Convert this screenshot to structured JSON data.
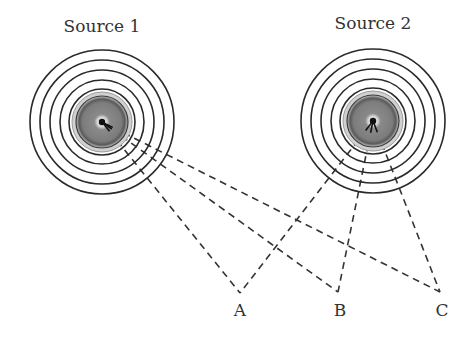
{
  "diagram": {
    "sources": [
      {
        "id": "source-1",
        "label": "Source 1",
        "cx": 102,
        "cy": 122,
        "label_x": 102,
        "label_y": 16
      },
      {
        "id": "source-2",
        "label": "Source 2",
        "cx": 373,
        "cy": 121,
        "label_x": 373,
        "label_y": 13
      }
    ],
    "ring_radii": [
      33,
      42,
      52,
      62,
      72
    ],
    "disc_radius": 28,
    "points": [
      {
        "id": "A",
        "label": "A",
        "x": 240,
        "y": 293,
        "label_x": 240,
        "label_y": 300
      },
      {
        "id": "B",
        "label": "B",
        "x": 338,
        "y": 292,
        "label_x": 340,
        "label_y": 300
      },
      {
        "id": "C",
        "label": "C",
        "x": 440,
        "y": 292,
        "label_x": 442,
        "label_y": 300
      }
    ],
    "colors": {
      "ring": "#2a2a2a",
      "disc_outer": "#bdbdbd",
      "disc_inner": "#7a7a7a",
      "path_line": "#333333"
    }
  }
}
